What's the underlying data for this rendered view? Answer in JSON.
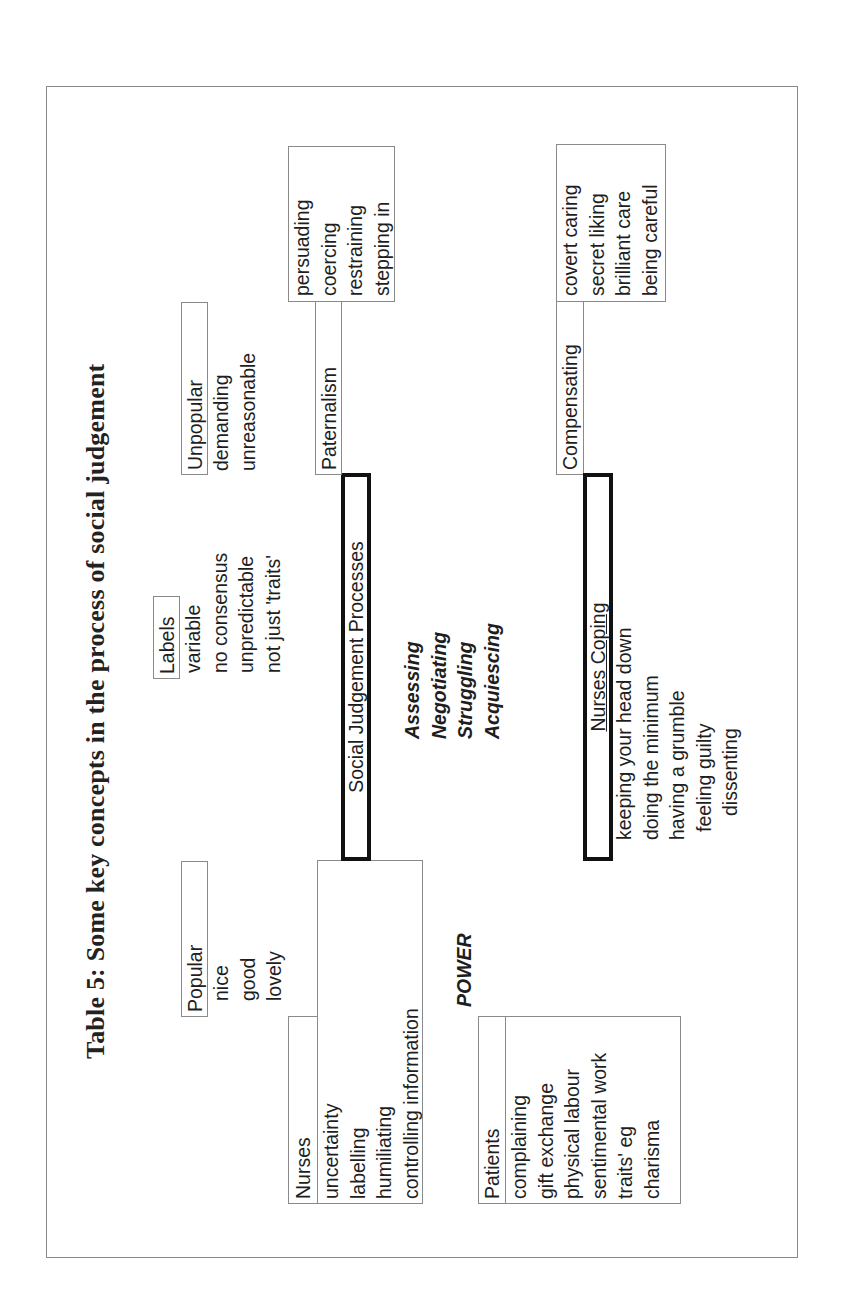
{
  "title": "Table 5:  Some key concepts in the process of social judgement",
  "labels": {
    "heading": "Labels",
    "items": [
      "variable",
      "no consensus",
      "unpredictable",
      "not just 'traits'"
    ]
  },
  "popular": {
    "heading": "Popular",
    "items": [
      "nice",
      "good",
      "lovely"
    ]
  },
  "unpopular": {
    "heading": "Unpopular",
    "items": [
      "demanding",
      "unreasonable"
    ]
  },
  "paternalism": {
    "heading": "Paternalism",
    "items": [
      "persuading",
      "coercing",
      "restraining",
      "stepping in"
    ]
  },
  "social_judgement": {
    "heading": "Social Judgement Processes",
    "processes": [
      "Assessing",
      "Negotiating",
      "Struggling",
      "Acquiescing"
    ]
  },
  "nurses": {
    "heading": "Nurses",
    "items": [
      "uncertainty",
      "labelling",
      "humiliating",
      "controlling information"
    ]
  },
  "power": "POWER",
  "patients": {
    "heading": "Patients",
    "items": [
      "complaining",
      "gift exchange",
      "physical labour",
      "sentimental work",
      "traits' eg",
      "charisma"
    ]
  },
  "compensating": {
    "heading": "Compensating",
    "items": [
      "covert caring",
      "secret liking",
      "brilliant care",
      "being careful"
    ]
  },
  "nurses_coping": {
    "heading": "Nurses Coping",
    "items": [
      "keeping your head down",
      "doing the minimum",
      "having a grumble",
      "feeling guilty",
      "dissenting"
    ]
  }
}
